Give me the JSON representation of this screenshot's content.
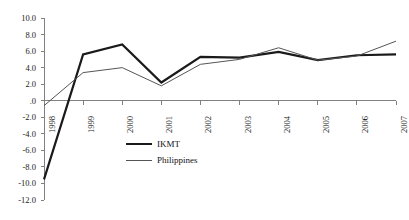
{
  "chart_data": {
    "type": "line",
    "title": "",
    "subtitle": "",
    "xlabel": "",
    "ylabel": "",
    "categories": [
      "1998",
      "1999",
      "2000",
      "2001",
      "2002",
      "2003",
      "2004",
      "2005",
      "2006",
      "2007"
    ],
    "series": [
      {
        "name": "IKMT",
        "values": [
          -9.5,
          5.6,
          6.8,
          2.2,
          5.3,
          5.2,
          5.9,
          4.9,
          5.5,
          5.6
        ],
        "color": "#1a1a1a",
        "line_width": 2.2,
        "style": "thick"
      },
      {
        "name": "Philippines",
        "values": [
          -0.6,
          3.4,
          4.0,
          1.8,
          4.4,
          5.0,
          6.4,
          4.9,
          5.4,
          7.2
        ],
        "color": "#555555",
        "line_width": 1.0,
        "style": "thin"
      }
    ],
    "ylim": [
      -12.0,
      10.0
    ],
    "ytick_step": 2.0,
    "ytick_labels": [
      "10.0",
      "8.0",
      "6.0",
      "4.0",
      "2.0",
      ".0",
      "-2.0",
      "-4.0",
      "-6.0",
      "-8.0",
      "-10.0",
      "-12.0"
    ],
    "ytick_values": [
      10,
      8,
      6,
      4,
      2,
      0,
      -2,
      -4,
      -6,
      -8,
      -10,
      -12
    ],
    "grid": false,
    "zero_line": true,
    "legend_position": "inside-lower-left",
    "xtick_rotation": -90,
    "background": "#ffffff",
    "axis_color": "#808080"
  },
  "legend": {
    "entries": [
      {
        "label": "IKMT"
      },
      {
        "label": "Philippines"
      }
    ]
  }
}
